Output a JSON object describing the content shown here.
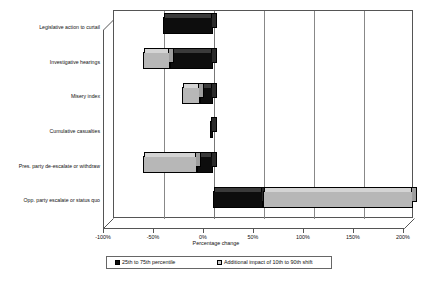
{
  "chart_data": {
    "type": "bar",
    "orientation": "horizontal",
    "stacked": true,
    "title": "",
    "xlabel": "Percentage change",
    "ylabel": "",
    "xlim": [
      -100,
      200
    ],
    "xticks": [
      "-100%",
      "-50%",
      "0%",
      "50%",
      "100%",
      "150%",
      "200%"
    ],
    "xtick_values": [
      -100,
      -50,
      0,
      50,
      100,
      150,
      200
    ],
    "grid": true,
    "legend_position": "bottom",
    "categories": [
      "Legislative action to curtail",
      "Investigative hearings",
      "Misery index",
      "Cumulative casualties",
      "Pres. party de-escalate or withdraw",
      "Opp. party escalate or status quo"
    ],
    "series": [
      {
        "name": "25th to 75th percentile",
        "color": "#0d0d0d",
        "bars": [
          {
            "category": "Legislative action to curtail",
            "start": -50,
            "end": 0
          },
          {
            "category": "Investigative hearings",
            "start": -43,
            "end": 0
          },
          {
            "category": "Misery index",
            "start": -13,
            "end": 0
          },
          {
            "category": "Cumulative casualties",
            "start": -3,
            "end": 0
          },
          {
            "category": "Pres. party de-escalate or withdraw",
            "start": -16,
            "end": 0
          },
          {
            "category": "Opp. party escalate or status quo",
            "start": 0,
            "end": 50
          }
        ]
      },
      {
        "name": "Additional impact of 10th to 90th shift",
        "color": "#b7b7b7",
        "bars": [
          {
            "category": "Legislative action to curtail",
            "start": -50,
            "end": -50
          },
          {
            "category": "Investigative hearings",
            "start": -70,
            "end": -43
          },
          {
            "category": "Misery index",
            "start": -31,
            "end": -13
          },
          {
            "category": "Cumulative casualties",
            "start": -3,
            "end": -3
          },
          {
            "category": "Pres. party de-escalate or withdraw",
            "start": -70,
            "end": -16
          },
          {
            "category": "Opp. party escalate or status quo",
            "start": 50,
            "end": 200
          }
        ]
      }
    ]
  },
  "legend": {
    "entries": [
      {
        "label": "25th to 75th percentile",
        "swatch": "black"
      },
      {
        "label": "Additional impact of 10th to 90th shift",
        "swatch": "gray"
      }
    ]
  },
  "axis": {
    "x_title": "Percentage change"
  }
}
